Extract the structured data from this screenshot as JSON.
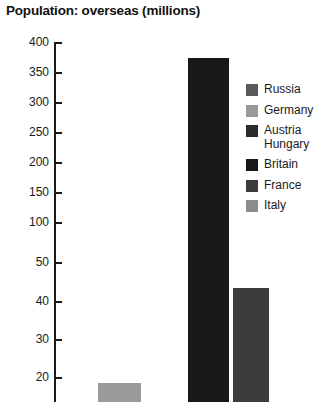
{
  "chart_data": {
    "type": "bar",
    "title": "Population: overseas (millions)",
    "xlabel": "",
    "ylabel": "",
    "grid": false,
    "legend_position": "right",
    "axis_note": "broken y-axis: 10-50 in steps of 10 (lower segment), 50-400 in steps of 50 (upper segment)",
    "ytick_labels": [
      "400",
      "350",
      "300",
      "250",
      "200",
      "150",
      "100",
      "50",
      "40",
      "30",
      "20",
      "10"
    ],
    "ytick_values": [
      400,
      350,
      300,
      250,
      200,
      150,
      100,
      50,
      40,
      30,
      20,
      10
    ],
    "ylim": [
      0,
      400
    ],
    "categories": [
      "Russia",
      "Germany",
      "Austria Hungary",
      "Britain",
      "France",
      "Italy"
    ],
    "values": [
      null,
      11,
      null,
      370,
      34,
      null
    ],
    "series": [
      {
        "name": "Population: overseas (millions)",
        "values": [
          null,
          11,
          null,
          370,
          34,
          null
        ]
      }
    ],
    "bars": [
      {
        "label": "Germany",
        "value": 11,
        "color": "#9a9a9a"
      },
      {
        "label": "Britain",
        "value": 370,
        "color": "#18181a"
      },
      {
        "label": "France",
        "value": 34,
        "color": "#3c3c3e"
      }
    ],
    "legend": [
      {
        "label": "Russia",
        "color": "#5a5a5c"
      },
      {
        "label": "Germany",
        "color": "#9a9a9a"
      },
      {
        "label": "Austria\nHungary",
        "color": "#2b2b2d"
      },
      {
        "label": "Britain",
        "color": "#18181a"
      },
      {
        "label": "France",
        "color": "#3c3c3e"
      },
      {
        "label": "Italy",
        "color": "#8c8c8e"
      }
    ]
  },
  "ticks": [
    {
      "label": "400",
      "top": 12
    },
    {
      "label": "350",
      "top": 42
    },
    {
      "label": "300",
      "top": 72
    },
    {
      "label": "250",
      "top": 102
    },
    {
      "label": "200",
      "top": 132
    },
    {
      "label": "150",
      "top": 162
    },
    {
      "label": "100",
      "top": 192
    },
    {
      "label": "50",
      "top": 232
    },
    {
      "label": "40",
      "top": 271
    },
    {
      "label": "30",
      "top": 309
    },
    {
      "label": "20",
      "top": 347
    },
    {
      "label": "10",
      "top": 385
    }
  ],
  "bar_geometry": [
    {
      "name": "germany",
      "left": 98,
      "width": 43,
      "top": 353
    },
    {
      "name": "britain",
      "left": 188,
      "width": 41,
      "top": 28
    },
    {
      "name": "france",
      "left": 233,
      "width": 36,
      "top": 258
    }
  ]
}
